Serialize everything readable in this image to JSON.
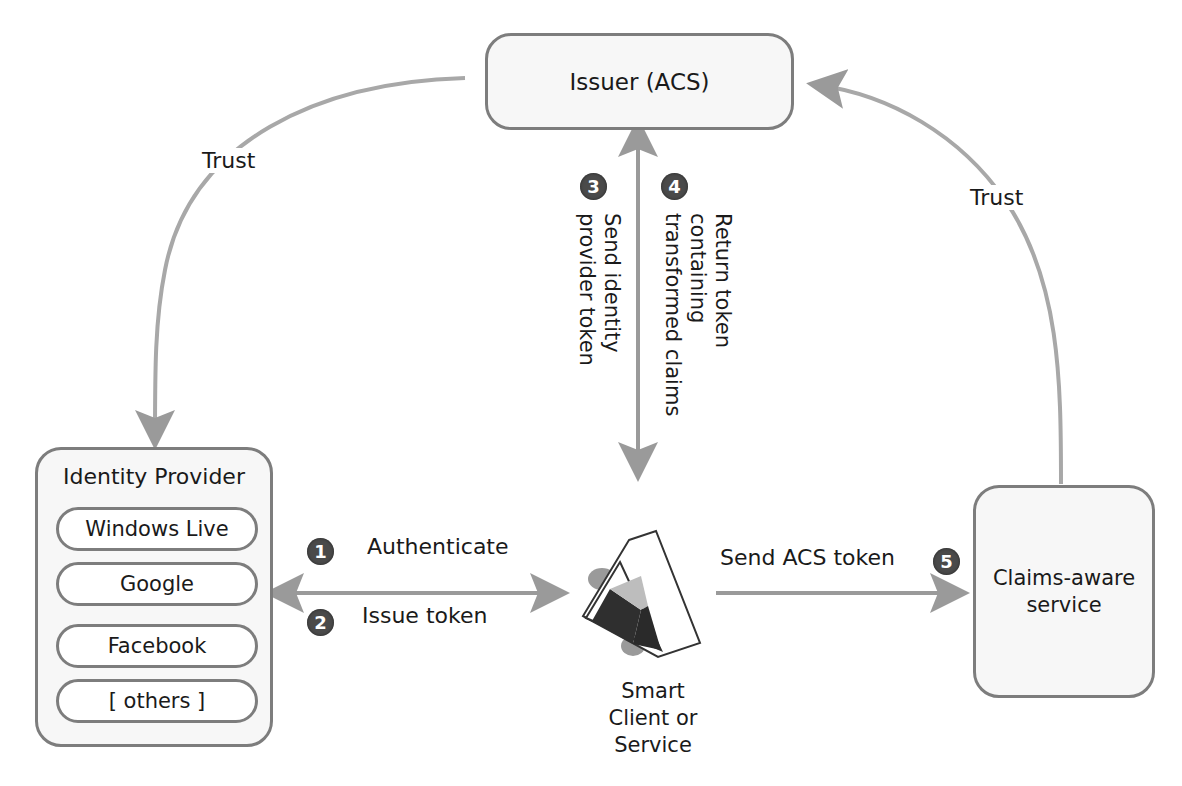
{
  "diagram": {
    "nodes": {
      "issuer": {
        "label": "Issuer (ACS)"
      },
      "identity_provider": {
        "title": "Identity Provider",
        "providers": [
          "Windows Live",
          "Google",
          "Facebook",
          "[ others ]"
        ]
      },
      "client": {
        "label_lines": [
          "Smart",
          "Client or",
          "Service"
        ],
        "icon": "smart-client-icon"
      },
      "service": {
        "label_lines": [
          "Claims-aware",
          "service"
        ]
      }
    },
    "trust_links": {
      "left": {
        "label": "Trust",
        "from": "issuer",
        "to": "identity_provider"
      },
      "right": {
        "label": "Trust",
        "from": "service",
        "to": "issuer"
      }
    },
    "steps": [
      {
        "number": "1",
        "label": "Authenticate"
      },
      {
        "number": "2",
        "label": "Issue token"
      },
      {
        "number": "3",
        "label_lines": [
          "Send identity",
          "provider token"
        ]
      },
      {
        "number": "4",
        "label_lines": [
          "Return token",
          "containing",
          "transformed claims"
        ]
      },
      {
        "number": "5",
        "label": "Send ACS token"
      }
    ],
    "colors": {
      "arrow": "#9a9a9a",
      "box_border": "#7d7d7d",
      "box_fill": "#f7f7f7",
      "badge": "#4a4a4a",
      "text": "#1a1a1a"
    }
  }
}
